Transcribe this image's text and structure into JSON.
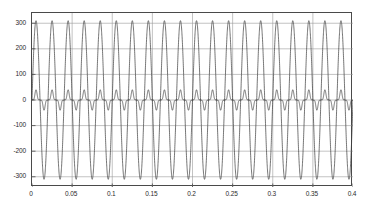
{
  "chart_data": {
    "type": "line",
    "title": "",
    "subtitle": "",
    "xlabel": "",
    "ylabel": "",
    "xlim": [
      0,
      0.4
    ],
    "ylim": [
      -340,
      340
    ],
    "grid": true,
    "legend": null,
    "legend_position": "none",
    "xticks": [
      0,
      0.05,
      0.1,
      0.15,
      0.2,
      0.25,
      0.3,
      0.35,
      0.4
    ],
    "xtick_labels": [
      "0",
      "0.05",
      "0.1",
      "0.15",
      "0.2",
      "0.25",
      "0.3",
      "0.35",
      "0.4"
    ],
    "yticks": [
      -300,
      -200,
      -100,
      0,
      100,
      200,
      300
    ],
    "ytick_labels": [
      "-300",
      "-200",
      "-100",
      "0",
      "100",
      "200",
      "300"
    ],
    "fundamental_frequency_hz": 50,
    "cycles_shown": 20,
    "series": [
      {
        "name": "voltage-sine",
        "waveform": "sine",
        "amplitude": 310,
        "frequency_hz": 50,
        "phase_deg": 0,
        "color": "#3a3a3a",
        "line_width": 0.7
      },
      {
        "name": "current-distorted",
        "waveform": "double-hump",
        "amplitude": 40,
        "frequency_hz": 50,
        "phase_deg": 0,
        "third_harmonic_ratio": 0.55,
        "fifth_harmonic_ratio": 0.18,
        "color": "#3a3a3a",
        "line_width": 0.7
      }
    ],
    "colors": {
      "background": "#ffffff",
      "axis": "#4a4a4a",
      "grid": "#9a9a9a",
      "tick_text": "#2b2b2b",
      "trace": "#3a3a3a"
    }
  }
}
